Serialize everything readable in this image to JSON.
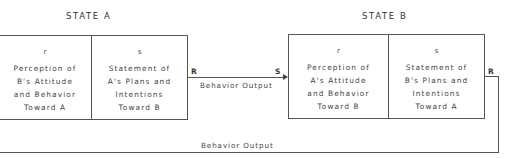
{
  "diagram": {
    "state_a": {
      "title": "STATE  A",
      "left_cell": {
        "letter": "r",
        "lines": [
          "Perception of",
          "B's Attitude",
          "and Behavior",
          "Toward A"
        ]
      },
      "right_cell": {
        "letter": "s",
        "lines": [
          "Statement of",
          "A's Plans and",
          "Intentions",
          "Toward B"
        ]
      },
      "output_port": "R"
    },
    "state_b": {
      "title": "STATE  B",
      "input_port": "S",
      "left_cell": {
        "letter": "r",
        "lines": [
          "Perception of",
          "A's Attitude",
          "and Behavior",
          "Toward B"
        ]
      },
      "right_cell": {
        "letter": "s",
        "lines": [
          "Statement of",
          "B's Plans and",
          "Intentions",
          "Toward A"
        ]
      },
      "output_port": "R"
    },
    "connections": {
      "a_to_b_label": "Behavior Output",
      "b_to_a_label": "Behavior Output"
    },
    "colors": {
      "line": "#555555",
      "text": "#444444",
      "background": "#ffffff"
    }
  }
}
